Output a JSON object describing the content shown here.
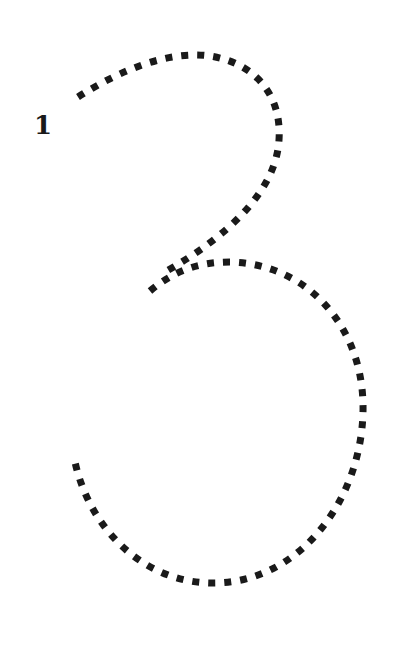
{
  "worksheet": {
    "digit": "3",
    "stroke_start_label": "1",
    "stroke_style": "dotted",
    "stroke_color": "#1a1a1a",
    "background": "#ffffff"
  }
}
